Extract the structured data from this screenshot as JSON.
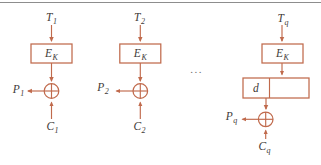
{
  "diagram": {
    "colors": {
      "accent": "#c06a4c",
      "label_text": "#3f3b38",
      "top_rule": "#8d8d8d",
      "ellipsis_text": "#6e6e6e",
      "background": "#ffffff"
    },
    "ellipsis": "...",
    "columns": [
      {
        "name": "block-1",
        "counter": {
          "main": "T",
          "sub": "1"
        },
        "cipher": {
          "main": "E",
          "sub": "K"
        },
        "plaintext": {
          "main": "P",
          "sub": "1"
        },
        "ciphertext": {
          "main": "C",
          "sub": "1"
        }
      },
      {
        "name": "block-2",
        "counter": {
          "main": "T",
          "sub": "2"
        },
        "cipher": {
          "main": "E",
          "sub": "K"
        },
        "plaintext": {
          "main": "P",
          "sub": "2"
        },
        "ciphertext": {
          "main": "C",
          "sub": "2"
        }
      },
      {
        "name": "block-q",
        "counter": {
          "main": "T",
          "sub": "q"
        },
        "cipher": {
          "main": "E",
          "sub": "K"
        },
        "selector": {
          "main": "d",
          "sub": ""
        },
        "plaintext": {
          "main": "P",
          "sub": "q"
        },
        "ciphertext": {
          "main": "C",
          "sub": "q"
        }
      }
    ]
  }
}
